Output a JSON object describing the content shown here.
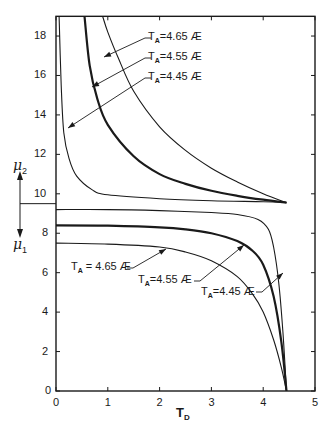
{
  "chart_data": {
    "type": "line",
    "title": "",
    "xlabel": "T_D",
    "xlabel_main": "T",
    "xlabel_sub": "D",
    "ylabel_upper": "μ2",
    "ylabel_upper_main": "μ",
    "ylabel_upper_sub": "2",
    "ylabel_lower": "μ1",
    "ylabel_lower_main": "μ",
    "ylabel_lower_sub": "1",
    "xlim": [
      0,
      5
    ],
    "ylim": [
      0,
      19
    ],
    "x_ticks": [
      "0",
      "1",
      "2",
      "3",
      "4",
      "5"
    ],
    "y_ticks": [
      "0",
      "2",
      "4",
      "6",
      "8",
      "10",
      "12",
      "14",
      "16",
      "18"
    ],
    "grid": false,
    "divider_mu": 9.5,
    "convergence": {
      "T_D": 4.45,
      "mu": 9.55
    },
    "series": [
      {
        "name": "T_A=4.65 Æ (μ2)",
        "branch": "mu2",
        "weight": "thin",
        "points": [
          [
            0.9,
            19
          ],
          [
            1.0,
            18.2
          ],
          [
            1.2,
            16.9
          ],
          [
            1.5,
            15.2
          ],
          [
            2.0,
            13.4
          ],
          [
            2.5,
            12.2
          ],
          [
            3.0,
            11.3
          ],
          [
            3.5,
            10.6
          ],
          [
            4.0,
            10.0
          ],
          [
            4.45,
            9.55
          ]
        ]
      },
      {
        "name": "T_A=4.55 Æ (μ2)",
        "branch": "mu2",
        "weight": "thick",
        "points": [
          [
            0.55,
            19
          ],
          [
            0.65,
            16.5
          ],
          [
            0.8,
            14.8
          ],
          [
            1.0,
            13.5
          ],
          [
            1.5,
            11.9
          ],
          [
            2.0,
            11.0
          ],
          [
            2.5,
            10.5
          ],
          [
            3.0,
            10.15
          ],
          [
            3.5,
            9.9
          ],
          [
            4.0,
            9.7
          ],
          [
            4.45,
            9.55
          ]
        ]
      },
      {
        "name": "T_A=4.45 Æ (μ2)",
        "branch": "mu2",
        "weight": "thin",
        "points": [
          [
            0.06,
            19
          ],
          [
            0.1,
            15.5
          ],
          [
            0.15,
            13.1
          ],
          [
            0.25,
            11.8
          ],
          [
            0.4,
            10.9
          ],
          [
            0.7,
            10.2
          ],
          [
            1.0,
            9.95
          ],
          [
            2.0,
            9.75
          ],
          [
            3.0,
            9.65
          ],
          [
            4.0,
            9.6
          ],
          [
            4.45,
            9.55
          ]
        ]
      },
      {
        "name": "T_A=4.45 Æ (μ1)",
        "branch": "mu1",
        "weight": "thin",
        "points": [
          [
            0,
            9.2
          ],
          [
            1.0,
            9.2
          ],
          [
            2.0,
            9.15
          ],
          [
            3.0,
            9.05
          ],
          [
            3.5,
            8.95
          ],
          [
            3.9,
            8.7
          ],
          [
            4.1,
            8.2
          ],
          [
            4.2,
            7.3
          ],
          [
            4.3,
            5.5
          ],
          [
            4.38,
            3.0
          ],
          [
            4.45,
            0
          ]
        ]
      },
      {
        "name": "T_A=4.55 Æ (μ1)",
        "branch": "mu1",
        "weight": "thick",
        "points": [
          [
            0,
            8.4
          ],
          [
            1.0,
            8.38
          ],
          [
            2.0,
            8.3
          ],
          [
            2.5,
            8.2
          ],
          [
            3.0,
            8.0
          ],
          [
            3.5,
            7.6
          ],
          [
            3.8,
            7.1
          ],
          [
            4.0,
            6.4
          ],
          [
            4.2,
            4.8
          ],
          [
            4.35,
            2.5
          ],
          [
            4.45,
            0
          ]
        ]
      },
      {
        "name": "T_A=4.65 Æ (μ1)",
        "branch": "mu1",
        "weight": "thin",
        "points": [
          [
            0,
            7.5
          ],
          [
            1.0,
            7.45
          ],
          [
            2.0,
            7.3
          ],
          [
            2.5,
            7.05
          ],
          [
            3.0,
            6.6
          ],
          [
            3.5,
            5.8
          ],
          [
            3.8,
            4.9
          ],
          [
            4.0,
            4.0
          ],
          [
            4.2,
            2.6
          ],
          [
            4.35,
            1.2
          ],
          [
            4.45,
            0
          ]
        ]
      }
    ],
    "annotations": [
      {
        "text_main": "T",
        "text_sub": "A",
        "text_rest": "=4.65 Æ",
        "group": "upper",
        "x_px": 148,
        "y_px": 31,
        "arrow_to": [
          104,
          57
        ],
        "line_from": [
          145,
          38
        ]
      },
      {
        "text_main": "T",
        "text_sub": "A",
        "text_rest": "=4.55 Æ",
        "group": "upper",
        "x_px": 148,
        "y_px": 51,
        "arrow_to": [
          92,
          87
        ],
        "line_from": [
          145,
          58
        ]
      },
      {
        "text_main": "T",
        "text_sub": "A",
        "text_rest": "=4.45 Æ",
        "group": "upper",
        "x_px": 148,
        "y_px": 71,
        "arrow_to": [
          68,
          128
        ],
        "line_from": [
          145,
          78
        ]
      },
      {
        "text_main": "T",
        "text_sub": "A",
        "text_rest": " = 4.65 Æ",
        "group": "lower",
        "x_px": 71,
        "y_px": 261,
        "arrow_to": [
          166,
          249
        ],
        "line_from": [
          133,
          268
        ]
      },
      {
        "text_main": "T",
        "text_sub": "A",
        "text_rest": "=4.55 Æ",
        "group": "lower",
        "x_px": 138,
        "y_px": 274,
        "arrow_to": [
          244,
          245
        ],
        "line_from": [
          200,
          281
        ]
      },
      {
        "text_main": "T",
        "text_sub": "A",
        "text_rest": "=4.45 Æ",
        "group": "lower",
        "x_px": 201,
        "y_px": 286,
        "arrow_to": [
          283,
          273
        ],
        "line_from": [
          262,
          292
        ]
      }
    ]
  }
}
